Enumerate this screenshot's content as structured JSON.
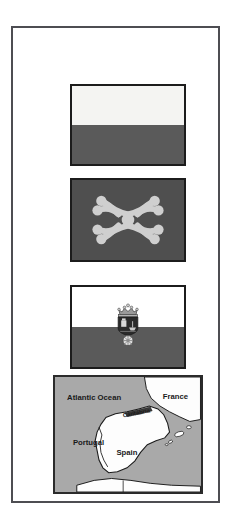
{
  "page": {
    "background_color": "#ffffff",
    "frame_color": "#4d4d52"
  },
  "figures": [
    {
      "id": "flag-plain",
      "name": "flag-of-cantabria-plain",
      "caption": "",
      "type": "flag",
      "description": "Horizontal bicolour: white over red (rendered greyscale)",
      "bands": [
        {
          "label": "white",
          "color": "#f4f4f2"
        },
        {
          "label": "red",
          "color": "#5a5a5a"
        }
      ]
    },
    {
      "id": "flag-labaro",
      "name": "flag-with-labaro-cantabro",
      "caption": "",
      "type": "flag",
      "description": "Labaro cantabro emblem on dark field",
      "field_color": "#4f4f4f",
      "emblem_color": "#cfcfcf",
      "emblem_name": "labaro-cantabro"
    },
    {
      "id": "flag-arms",
      "name": "flag-of-cantabria-with-coat-of-arms",
      "caption": "",
      "type": "flag",
      "description": "Horizontal bicolour with the coat of arms of Cantabria centred",
      "bands": [
        {
          "label": "white",
          "color": "#ffffff"
        },
        {
          "label": "red",
          "color": "#5a5a5a"
        }
      ],
      "emblem_name": "coat-of-arms-of-cantabria"
    },
    {
      "id": "map",
      "name": "locator-map-of-cantabria",
      "caption": "",
      "type": "map",
      "ocean_color": "#a9a9a9",
      "land_color": "#fdfdfd",
      "outline_color": "#1a1a1a"
    }
  ],
  "map": {
    "labels": {
      "ocean": "Atlantic Ocean",
      "france": "France",
      "portugal": "Portugal",
      "spain": "Spain",
      "region": "Cantabria"
    }
  }
}
